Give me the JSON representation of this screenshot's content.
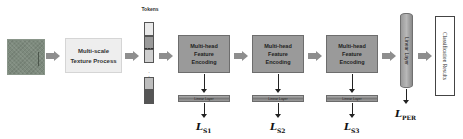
{
  "diagram": {
    "input": {
      "label": "input-texture-image"
    },
    "multiscale": {
      "line1": "Multi-scale",
      "line2": "Texture Process"
    },
    "tokens": {
      "label": "Tokens",
      "dots": "⋮",
      "colors": [
        "#e9e9e9",
        "#9a9a9a",
        "#cfcfcf",
        "#bdbdbd",
        "#555555"
      ]
    },
    "encoders": [
      {
        "line1": "Multi-head",
        "line2": "Feature",
        "line3": "Encoding",
        "linear": "Linear Layer",
        "loss": "L",
        "loss_sub": "S1"
      },
      {
        "line1": "Multi-head",
        "line2": "Feature",
        "line3": "Encoding",
        "linear": "Linear Layer",
        "loss": "L",
        "loss_sub": "S2"
      },
      {
        "line1": "Multi-head",
        "line2": "Feature",
        "line3": "Encoding",
        "linear": "Linear Layer",
        "loss": "L",
        "loss_sub": "S3"
      }
    ],
    "final_linear": {
      "label": "Linear Layer",
      "loss": "L",
      "loss_sub": "PER"
    },
    "output": {
      "label": "Classification Results"
    }
  },
  "colors": {
    "arrow": "#8e8e8e",
    "encoder_fill": "#9a9a9a",
    "multiscale_fill": "#eeeeee"
  }
}
